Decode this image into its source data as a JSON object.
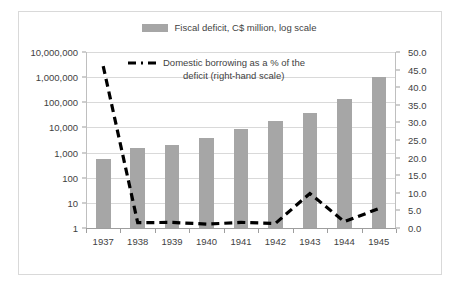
{
  "chart_data": {
    "type": "bar",
    "title": "",
    "categories": [
      "1937",
      "1938",
      "1939",
      "1940",
      "1941",
      "1942",
      "1943",
      "1944",
      "1945"
    ],
    "xlabel": "",
    "ylabel": "",
    "y_left": {
      "label": "Fiscal deficit, C$ million, log scale",
      "scale": "log",
      "ticks": [
        "1",
        "10",
        "100",
        "1,000",
        "10,000",
        "100,000",
        "1,000,000",
        "10,000,000"
      ],
      "tick_values": [
        1,
        10,
        100,
        1000,
        10000,
        100000,
        1000000,
        10000000
      ],
      "ylim": [
        1,
        10000000
      ]
    },
    "y_right": {
      "label": "Domestic borrowing as a % of the deficit (right-hand scale)",
      "scale": "linear",
      "ticks": [
        "0.0",
        "5.0",
        "10.0",
        "15.0",
        "20.0",
        "25.0",
        "30.0",
        "35.0",
        "40.0",
        "45.0",
        "50.0"
      ],
      "tick_values": [
        0,
        5,
        10,
        15,
        20,
        25,
        30,
        35,
        40,
        45,
        50
      ],
      "ylim": [
        0,
        50
      ]
    },
    "grid": true,
    "legend_position": "top",
    "series": [
      {
        "name": "Fiscal deficit, C$ million, log scale",
        "type": "bar",
        "axis": "left",
        "color": "#a6a6a6",
        "values": [
          550,
          1500,
          2000,
          3800,
          8500,
          18000,
          38000,
          130000,
          1050000
        ]
      },
      {
        "name": "Domestic borrowing as a % of the deficit (right-hand scale)",
        "type": "line",
        "axis": "right",
        "color": "#000000",
        "style": "dashed",
        "values": [
          46.0,
          1.5,
          1.6,
          1.1,
          1.6,
          1.3,
          9.8,
          1.8,
          5.5
        ]
      }
    ]
  },
  "legend": {
    "bar_series_label": "Fiscal deficit, C$ million, log scale",
    "line_series_label_line1": "Domestic borrowing as a % of the",
    "line_series_label_line2": "deficit (right-hand scale)",
    "bar_swatch_color": "#a6a6a6",
    "line_color": "#000000"
  },
  "colors": {
    "bar_fill": "#a6a6a6",
    "line": "#000000",
    "gridline": "#d9d9d9",
    "axis": "#9e9e9e",
    "frame_border": "#d9d9d9",
    "text": "#3f3f3f",
    "background": "#ffffff"
  }
}
